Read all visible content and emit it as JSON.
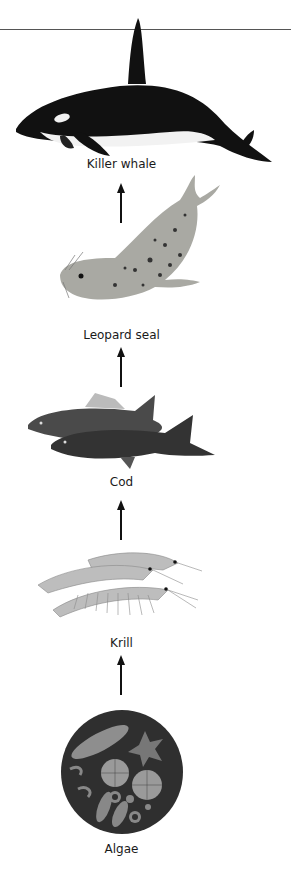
{
  "diagram": {
    "water_surface_line": true,
    "direction": "bottom-to-top (energy flow)",
    "organisms": [
      {
        "id": "killer-whale",
        "label": "Killer whale",
        "level": 5
      },
      {
        "id": "leopard-seal",
        "label": "Leopard seal",
        "level": 4
      },
      {
        "id": "cod",
        "label": "Cod",
        "level": 3
      },
      {
        "id": "krill",
        "label": "Krill",
        "level": 2
      },
      {
        "id": "algae",
        "label": "Algae",
        "level": 1
      }
    ],
    "arrows": [
      {
        "from": "Leopard seal",
        "to": "Killer whale"
      },
      {
        "from": "Cod",
        "to": "Leopard seal"
      },
      {
        "from": "Krill",
        "to": "Cod"
      },
      {
        "from": "Algae",
        "to": "Krill"
      }
    ],
    "colors": {
      "background": "#ffffff",
      "line": "#555555",
      "arrow": "#111111",
      "text": "#1a1a1a",
      "orca_black": "#111111",
      "orca_white": "#f2f2f2",
      "seal_body": "#a9a9a3",
      "cod_body": "#3a3a3a",
      "krill_body": "#b8b8b8",
      "algae_disc": "#2f2f2f"
    }
  }
}
